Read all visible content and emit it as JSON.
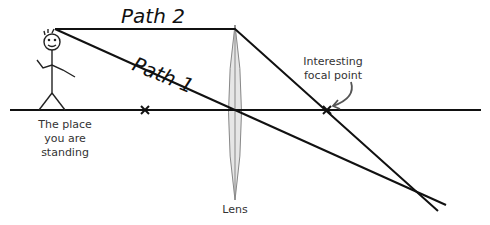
{
  "diagram": {
    "labels": {
      "path1": "Path 1",
      "path2": "Path 2",
      "standing_line1": "The place",
      "standing_line2": "you are",
      "standing_line3": "standing",
      "focal_line1": "Interesting",
      "focal_line2": "focal point",
      "lens": "Lens"
    },
    "colors": {
      "line": "#111111",
      "lens_fill": "#e6e6e6",
      "lens_stroke": "#888888",
      "text": "#333333",
      "arrow": "#555555"
    },
    "geometry": {
      "optical_axis_y": 110,
      "lens_x": 235,
      "focal_point_x": 327,
      "near_mark_x": 145,
      "eye_point": [
        55,
        29
      ]
    }
  }
}
